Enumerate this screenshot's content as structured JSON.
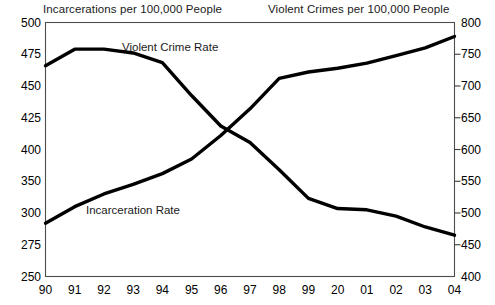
{
  "chart_data": {
    "type": "line",
    "title": "",
    "xlabel": "",
    "grid": false,
    "legend_position": "inline-annotations",
    "left_axis": {
      "label": "Incarcerations per 100,000 People",
      "ticks": [
        "500",
        "475",
        "450",
        "425",
        "400",
        "350",
        "300",
        "275",
        "250"
      ],
      "ylim": [
        250,
        500
      ]
    },
    "right_axis": {
      "label": "Violent Crimes per 100,000 People",
      "ticks": [
        "800",
        "750",
        "700",
        "650",
        "600",
        "550",
        "500",
        "450",
        "400"
      ],
      "ylim": [
        400,
        800
      ]
    },
    "x": [
      "90",
      "91",
      "92",
      "93",
      "94",
      "95",
      "96",
      "97",
      "98",
      "99",
      "20",
      "01",
      "02",
      "03",
      "04"
    ],
    "series": [
      {
        "name": "Incarceration Rate",
        "axis": "left",
        "annotation": "Incarceration Rate",
        "values": [
          292,
          310,
          330,
          345,
          362,
          385,
          411,
          432,
          456,
          461,
          464,
          468,
          474,
          480,
          489
        ]
      },
      {
        "name": "Violent Crime Rate",
        "axis": "right",
        "annotation": "Violent Crime Rate",
        "values": [
          732,
          758,
          758,
          752,
          737,
          685,
          637,
          611,
          568,
          523,
          507,
          505,
          495,
          478,
          465
        ]
      }
    ]
  }
}
